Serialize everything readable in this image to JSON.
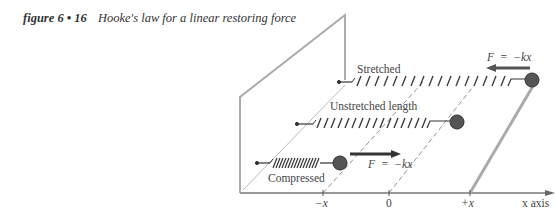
{
  "caption": {
    "figure_label": "figure 6 • 16",
    "title": "Hooke's law for a linear restoring force"
  },
  "diagram": {
    "springs": [
      {
        "state": "stretched",
        "label": "Stretched",
        "force_label": "F  =  −kx",
        "force_direction": "left"
      },
      {
        "state": "unstretched",
        "label": "Unstretched length"
      },
      {
        "state": "compressed",
        "label": "Compressed",
        "force_label": "F  =  −kx",
        "force_direction": "right"
      }
    ],
    "axis": {
      "ticks": [
        "−x",
        "0",
        "+x"
      ],
      "axis_label": "x axis"
    }
  },
  "colors": {
    "line": "#aaaaaa",
    "dark": "#333333",
    "mass": "#555555"
  }
}
